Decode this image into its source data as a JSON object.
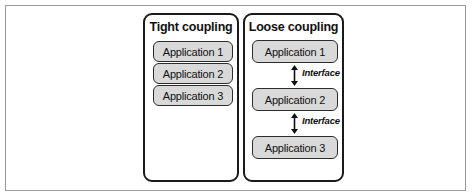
{
  "figure": {
    "frame_color": "#9b9b9b",
    "panel_border_color": "#1a1a1a",
    "box_fill_color": "#d9d9d9",
    "box_border_color": "#2b2b2b",
    "text_color": "#111111",
    "background_color": "#ffffff"
  },
  "panels": [
    {
      "id": "tight",
      "title": "Tight coupling",
      "coupling_style": "direct-stacked",
      "applications": [
        {
          "label": "Application 1"
        },
        {
          "label": "Application 2"
        },
        {
          "label": "Application 3"
        }
      ],
      "connectors": []
    },
    {
      "id": "loose",
      "title": "Loose coupling",
      "coupling_style": "interface-mediated",
      "applications": [
        {
          "label": "Application 1"
        },
        {
          "label": "Application 2"
        },
        {
          "label": "Application 3"
        }
      ],
      "connectors": [
        {
          "label": "Interface",
          "arrow": "double-headed-vertical",
          "between": [
            "Application 1",
            "Application 2"
          ]
        },
        {
          "label": "Interface",
          "arrow": "double-headed-vertical",
          "between": [
            "Application 2",
            "Application 3"
          ]
        }
      ]
    }
  ]
}
